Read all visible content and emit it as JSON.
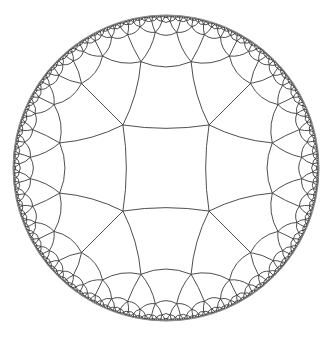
{
  "figure": {
    "type": "hyperbolic-tiling",
    "model": "Poincare disk",
    "schlafli": [
      4,
      5
    ],
    "disk": {
      "cx": 166,
      "cy": 168,
      "r": 153
    },
    "colors": {
      "background": "#ffffff",
      "edge": "#3a3a3a",
      "boundary": "#8a8a8a"
    },
    "stroke": {
      "edge": 0.9,
      "boundary": 1.0
    },
    "min_edge_px": 1.2
  }
}
